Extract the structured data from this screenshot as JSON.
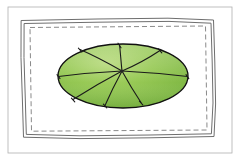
{
  "figure": {
    "title": "Hand-drawn green elliptical leaf with radiating veins inside a sketched rectangular frame",
    "caption": "",
    "background_color": "#ffffff",
    "canvas": {
      "width": 240,
      "height": 161
    }
  },
  "outer_border": {
    "name": "outer-rectangle-border",
    "stroke": "#b0b0b0",
    "stroke_width": 0.8,
    "x": 8,
    "y": 7,
    "width": 224,
    "height": 146
  },
  "sketch_frame": {
    "name": "hand-drawn-double-line-frame",
    "stroke": "#6e6e6e",
    "stroke_width": 1.0,
    "description": "Two wobbly concentric hand-drawn rectangle outlines",
    "outer_path": "M 21.5,20.5 L 97,19.0 L 168,18.2 L 213.5,20.0 L 214.8,62 L 215.6,104 L 214.0,136.5 L 150,137.8 L 80,138.6 L 23.5,137.2 L 22.4,100 L 21.0,58 Z",
    "inner_path": "M 24.5,23.5 L 98,22.2 L 169,21.4 L 211.0,23.2 L 212.2,62 L 213.0,103 L 211.4,133.8 L 150,135.0 L 80,135.8 L 26.3,134.4 L 25.3,99 L 24.0,58 Z"
  },
  "dashed_border": {
    "name": "dashed-inner-border",
    "stroke": "#8a8a8a",
    "stroke_width": 1.0,
    "dash_pattern": "5 3",
    "path": "M 30,27.5 L 205.5,26.0 L 207.0,130.0 L 31.5,131.2 Z"
  },
  "leaf": {
    "name": "green-leaf-ellipse",
    "shape": "ellipse",
    "center_x": 123,
    "center_y": 76,
    "radius_x": 65,
    "radius_y": 32,
    "outline_stroke": "#111111",
    "outline_stroke_width": 1.3,
    "fill_light": "#a9d26a",
    "fill_mid": "#8cc34a",
    "fill_dark": "#74b13c",
    "vein_stroke": "#1a1a1a",
    "vein_stroke_width": 1.1,
    "hub_x": 122,
    "hub_y": 71,
    "vein_count": 8,
    "extents": {
      "left": 58,
      "right": 188,
      "top": 44,
      "bottom": 108
    },
    "veins": [
      {
        "id": "vein-north",
        "path": "M 122,71 C 121,62 120.5,53 119.5,44.5",
        "tick": "M 119.5,43 L 119.5,47.5"
      },
      {
        "id": "vein-northeast",
        "path": "M 122,71 C 134,66 148,58.5 160,50.5",
        "tick": "M 159,49.5 L 162,52.5"
      },
      {
        "id": "vein-east",
        "path": "M 122,71 C 142,72 166,74 187.5,76.5",
        "tick": "M 186.5,75 L 188.5,78.5"
      },
      {
        "id": "vein-southeast",
        "path": "M 122,71 C 128,82 134,92 141,102.5",
        "tick": "M 140,101.5 L 142.5,104.5"
      },
      {
        "id": "vein-south",
        "path": "M 122,71 C 116,82 110,94 105,105.5",
        "tick": "M 104,104.5 L 106.5,107.5"
      },
      {
        "id": "vein-southwest",
        "path": "M 122,71 C 105,80 88,90 73,99.5",
        "tick": "M 72,98.5 L 74.5,101.5"
      },
      {
        "id": "vein-west",
        "path": "M 122,71 C 101,72 78,74 58.5,76.5",
        "tick": "M 57.5,75 L 60,78.5"
      },
      {
        "id": "vein-northwest",
        "path": "M 122,71 C 108,63 94,55.5 80,49.5",
        "tick": "M 79,48.5 L 81.5,51.5"
      }
    ]
  }
}
